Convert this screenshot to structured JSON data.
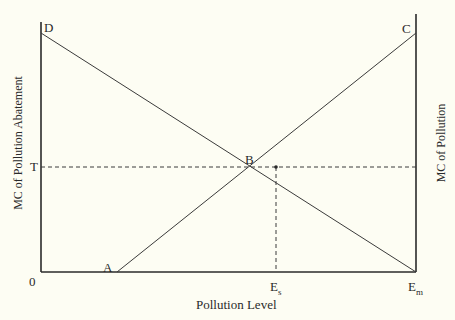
{
  "diagram": {
    "y_axis_left_label": "MC of Pollution Abatement",
    "y_axis_right_label": "MC of Pollution",
    "x_axis_label": "Pollution Level",
    "points": {
      "D": "D",
      "C": "C",
      "B": "B",
      "A": "A",
      "T": "T",
      "origin": "0",
      "Es_base": "E",
      "Es_sub": "s",
      "Em_base": "E",
      "Em_sub": "m"
    },
    "colors": {
      "background": "#fdfdf3",
      "axis": "#2a2a2a",
      "curve": "#3a3a3a",
      "dashed": "#3a3a3a"
    }
  }
}
